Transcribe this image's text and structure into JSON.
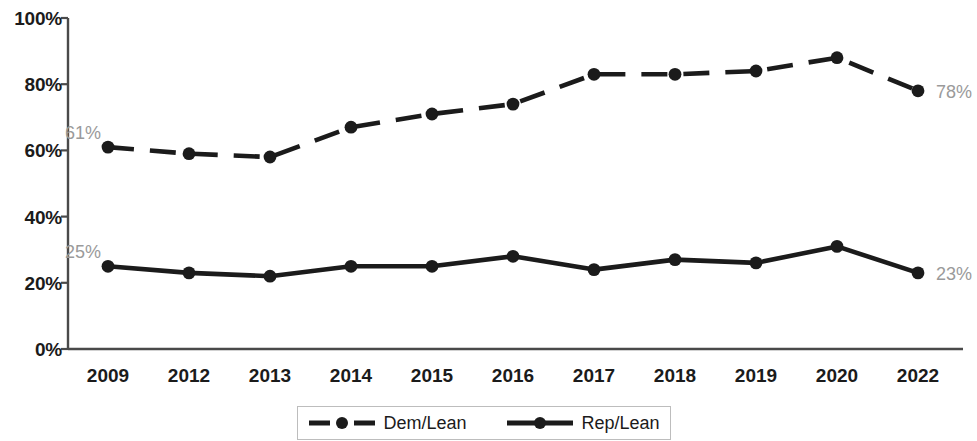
{
  "chart_data": {
    "type": "line",
    "title": "",
    "subtitle": "",
    "xlabel": "",
    "ylabel": "",
    "categories": [
      "2009",
      "2012",
      "2013",
      "2014",
      "2015",
      "2016",
      "2017",
      "2018",
      "2019",
      "2020",
      "2022"
    ],
    "ylim": [
      0,
      100
    ],
    "y_ticks": [
      "0%",
      "20%",
      "40%",
      "60%",
      "80%",
      "100%"
    ],
    "y_tick_values": [
      0,
      20,
      40,
      60,
      80,
      100
    ],
    "grid": false,
    "legend_position": "bottom",
    "series": [
      {
        "name": "Dem/Lean",
        "style": "dashed",
        "color": "#1b1b1b",
        "marker": "circle",
        "values": [
          61,
          59,
          58,
          67,
          71,
          74,
          83,
          83,
          84,
          88,
          78
        ],
        "start_label": "61%",
        "end_label": "78%"
      },
      {
        "name": "Rep/Lean",
        "style": "solid",
        "color": "#1b1b1b",
        "marker": "circle",
        "values": [
          25,
          23,
          22,
          25,
          25,
          28,
          24,
          27,
          26,
          31,
          23
        ],
        "start_label": "25%",
        "end_label": "23%"
      }
    ],
    "annotations": [
      {
        "text": "61%",
        "series": "Dem/Lean",
        "position": "start"
      },
      {
        "text": "78%",
        "series": "Dem/Lean",
        "position": "end"
      },
      {
        "text": "25%",
        "series": "Rep/Lean",
        "position": "start"
      },
      {
        "text": "23%",
        "series": "Rep/Lean",
        "position": "end"
      }
    ],
    "colors": {
      "line": "#1b1b1b",
      "axis": "#4a4a4a",
      "tick_label": "#1b1b1b",
      "annotation": "#9a9a9a",
      "legend_border": "#bdbdbd",
      "background": "#ffffff"
    }
  }
}
